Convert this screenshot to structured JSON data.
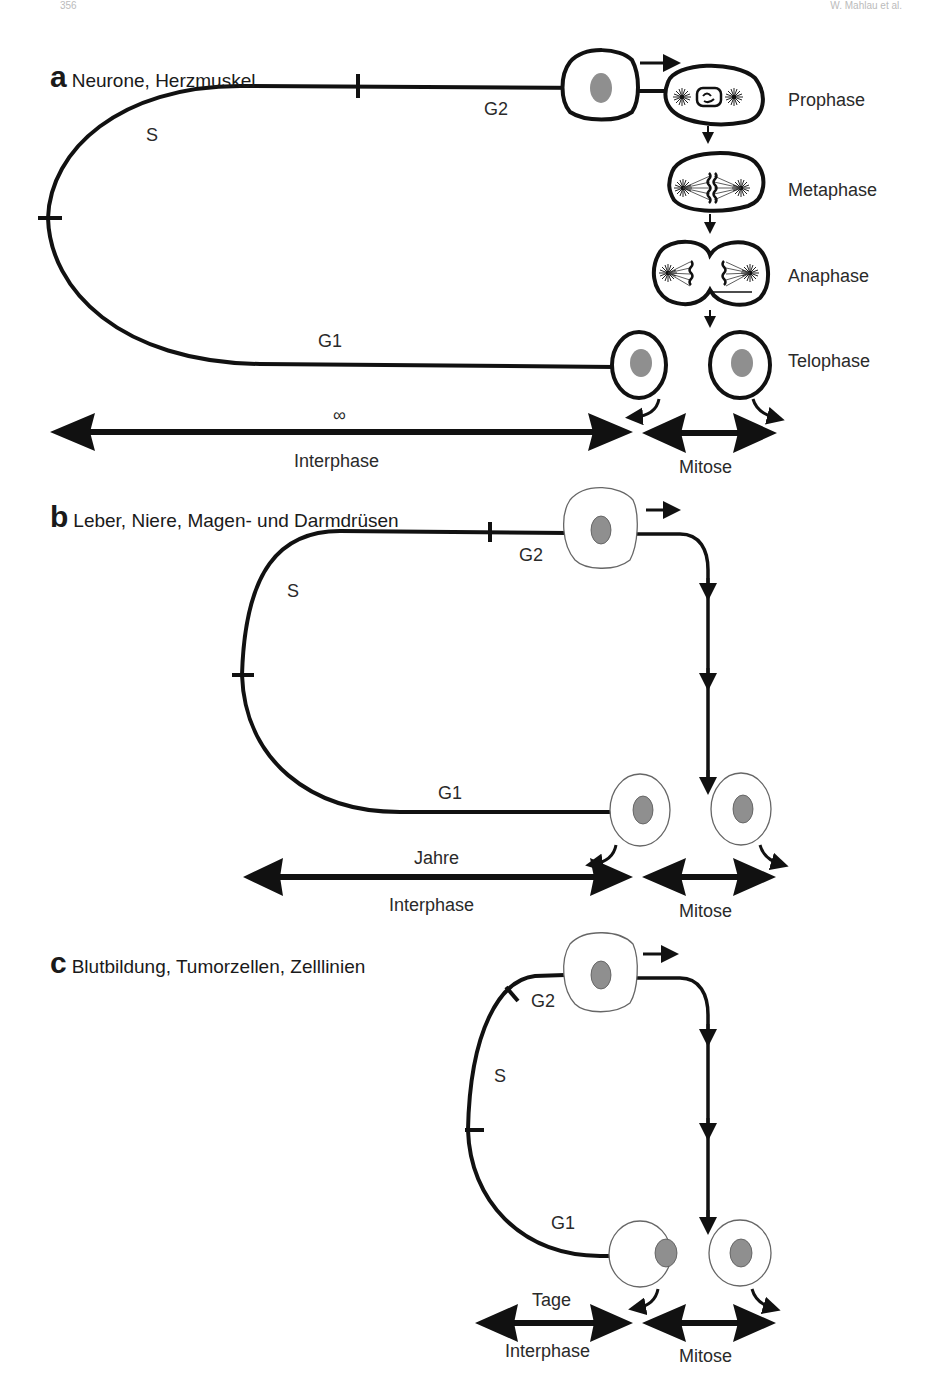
{
  "page_header": {
    "left": "356",
    "right": "W. Mahlau et al."
  },
  "panels": [
    {
      "letter": "a",
      "title": "Neurone, Herzmuskel",
      "phases": {
        "s": "S",
        "g1": "G1",
        "g2": "G2"
      },
      "duration": "∞",
      "interphase_label": "Interphase",
      "mitose_label": "Mitose",
      "mitosis_stages": [
        "Prophase",
        "Metaphase",
        "Anaphase",
        "Telophase"
      ]
    },
    {
      "letter": "b",
      "title": "Leber, Niere, Magen- und Darmdrüsen",
      "phases": {
        "s": "S",
        "g1": "G1",
        "g2": "G2"
      },
      "duration": "Jahre",
      "interphase_label": "Interphase",
      "mitose_label": "Mitose"
    },
    {
      "letter": "c",
      "title": "Blutbildung, Tumorzellen, Zelllinien",
      "phases": {
        "s": "S",
        "g1": "G1",
        "g2": "G2"
      },
      "duration": "Tage",
      "interphase_label": "Interphase",
      "mitose_label": "Mitose"
    }
  ],
  "colors": {
    "line": "#111111",
    "nucleus": "#8f8f8f",
    "cell_outline_thin": "#555555"
  }
}
